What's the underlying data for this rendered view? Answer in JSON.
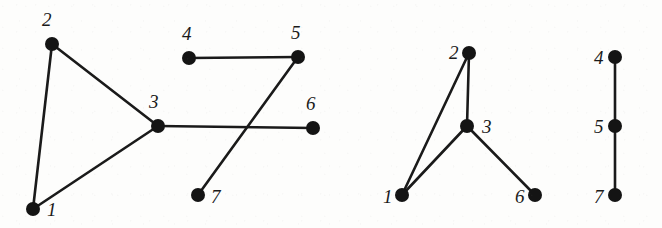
{
  "figure": {
    "background_color": "#fdfdfc",
    "ink_color": "#141414",
    "node_radius": 7,
    "edge_width": 2.6,
    "canvas": {
      "width": 662,
      "height": 228
    }
  },
  "graphs": [
    {
      "id": "graph-1",
      "name": "original-graph",
      "nodes": [
        {
          "id": "g1-n1",
          "label": "1",
          "x": 33,
          "y": 209,
          "label_x": 47,
          "label_y": 200
        },
        {
          "id": "g1-n2",
          "label": "2",
          "x": 52,
          "y": 44,
          "label_x": 42,
          "label_y": 10
        },
        {
          "id": "g1-n3",
          "label": "3",
          "x": 158,
          "y": 126,
          "label_x": 149,
          "label_y": 92
        },
        {
          "id": "g1-n4",
          "label": "4",
          "x": 189,
          "y": 58,
          "label_x": 182,
          "label_y": 24
        },
        {
          "id": "g1-n5",
          "label": "5",
          "x": 298,
          "y": 57,
          "label_x": 291,
          "label_y": 23
        },
        {
          "id": "g1-n6",
          "label": "6",
          "x": 313,
          "y": 128,
          "label_x": 306,
          "label_y": 94
        },
        {
          "id": "g1-n7",
          "label": "7",
          "x": 198,
          "y": 195,
          "label_x": 211,
          "label_y": 187
        }
      ],
      "edges": [
        {
          "id": "g1-e12",
          "from": "g1-n1",
          "to": "g1-n2"
        },
        {
          "id": "g1-e13",
          "from": "g1-n1",
          "to": "g1-n3"
        },
        {
          "id": "g1-e23",
          "from": "g1-n2",
          "to": "g1-n3"
        },
        {
          "id": "g1-e36",
          "from": "g1-n3",
          "to": "g1-n6"
        },
        {
          "id": "g1-e45",
          "from": "g1-n4",
          "to": "g1-n5"
        },
        {
          "id": "g1-e57",
          "from": "g1-n5",
          "to": "g1-n7"
        }
      ]
    },
    {
      "id": "graph-2",
      "name": "component-one",
      "nodes": [
        {
          "id": "g2-n1",
          "label": "1",
          "x": 402,
          "y": 195,
          "label_x": 383,
          "label_y": 187
        },
        {
          "id": "g2-n2",
          "label": "2",
          "x": 469,
          "y": 53,
          "label_x": 449,
          "label_y": 43
        },
        {
          "id": "g2-n3",
          "label": "3",
          "x": 467,
          "y": 126,
          "label_x": 482,
          "label_y": 117
        },
        {
          "id": "g2-n6",
          "label": "6",
          "x": 535,
          "y": 195,
          "label_x": 515,
          "label_y": 187
        }
      ],
      "edges": [
        {
          "id": "g2-e12",
          "from": "g2-n1",
          "to": "g2-n2"
        },
        {
          "id": "g2-e13",
          "from": "g2-n1",
          "to": "g2-n3"
        },
        {
          "id": "g2-e23",
          "from": "g2-n2",
          "to": "g2-n3"
        },
        {
          "id": "g2-e36",
          "from": "g2-n3",
          "to": "g2-n6"
        }
      ]
    },
    {
      "id": "graph-3",
      "name": "component-two",
      "nodes": [
        {
          "id": "g3-n4",
          "label": "4",
          "x": 615,
          "y": 57,
          "label_x": 594,
          "label_y": 48
        },
        {
          "id": "g3-n5",
          "label": "5",
          "x": 615,
          "y": 126,
          "label_x": 594,
          "label_y": 117
        },
        {
          "id": "g3-n7",
          "label": "7",
          "x": 615,
          "y": 195,
          "label_x": 594,
          "label_y": 187
        }
      ],
      "edges": [
        {
          "id": "g3-e45",
          "from": "g3-n4",
          "to": "g3-n5"
        },
        {
          "id": "g3-e57",
          "from": "g3-n5",
          "to": "g3-n7"
        }
      ]
    }
  ]
}
